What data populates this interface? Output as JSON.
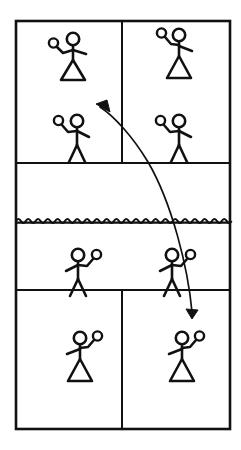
{
  "diagram": {
    "title": "Doubles tennis court play diagram",
    "kind": "sports-court-diagram",
    "sport": "Tennis",
    "view": "top-down",
    "colors": {
      "line": "#111111",
      "background": "#ffffff",
      "figure": "#111111"
    },
    "court": {
      "label": "Tennis court outline",
      "x": 16,
      "y": 21,
      "width": 214,
      "height": 408,
      "stroke_width": 2.4
    },
    "net": {
      "label": "Net",
      "y": 221,
      "x1": 16,
      "x2": 230,
      "style": "wavy",
      "wave_count": 22,
      "wave_amplitude": 3.2
    },
    "lines": [
      {
        "name": "far-service-line",
        "label": "Far service line",
        "x1": 16,
        "y1": 163,
        "x2": 230,
        "y2": 163
      },
      {
        "name": "near-service-line",
        "label": "Near service line",
        "x1": 16,
        "y1": 290,
        "x2": 230,
        "y2": 290
      },
      {
        "name": "far-center-service-line",
        "label": "Far centre service line",
        "x1": 122,
        "y1": 21,
        "x2": 122,
        "y2": 163
      },
      {
        "name": "near-center-service-line",
        "label": "Near centre service line",
        "x1": 122,
        "y1": 290,
        "x2": 122,
        "y2": 429
      }
    ],
    "players": [
      {
        "id": "far-left-back",
        "label": "Far court left player (skirt)",
        "type": "skirt",
        "racket_side": "left",
        "x": 66,
        "y": 48
      },
      {
        "id": "far-right-back",
        "label": "Far court right player (skirt)",
        "type": "skirt",
        "racket_side": "left",
        "x": 172,
        "y": 44
      },
      {
        "id": "far-left-net",
        "label": "Far court left net player (legs)",
        "type": "legs",
        "racket_side": "left",
        "x": 70,
        "y": 128
      },
      {
        "id": "far-right-net",
        "label": "Far court right net player (legs)",
        "type": "legs",
        "racket_side": "left",
        "x": 172,
        "y": 128
      },
      {
        "id": "near-left-net",
        "label": "Near court left net player (legs)",
        "type": "legs",
        "racket_side": "right",
        "x": 78,
        "y": 262
      },
      {
        "id": "near-right-net",
        "label": "Near court right net player (legs)",
        "type": "legs",
        "racket_side": "right",
        "x": 172,
        "y": 262
      },
      {
        "id": "near-left-back",
        "label": "Near court left player (skirt)",
        "type": "skirt",
        "racket_side": "right",
        "x": 80,
        "y": 347
      },
      {
        "id": "near-right-back",
        "label": "Near court right player (skirt)",
        "type": "skirt",
        "racket_side": "right",
        "x": 182,
        "y": 347
      }
    ],
    "trajectory": {
      "label": "Ball trajectory (lob returned cross-court)",
      "path": "M 192 311 C 186 266 170 200 146 158 C 132 134 114 115 100 107",
      "start_arrow": {
        "name": "down-arrowhead",
        "label": "Landing point arrowhead",
        "x": 192,
        "y": 318,
        "direction": "down"
      },
      "end_arrow": {
        "name": "up-arrowhead",
        "label": "Direction of play arrowhead",
        "x": 97,
        "y": 105,
        "direction": "up-left"
      }
    }
  }
}
